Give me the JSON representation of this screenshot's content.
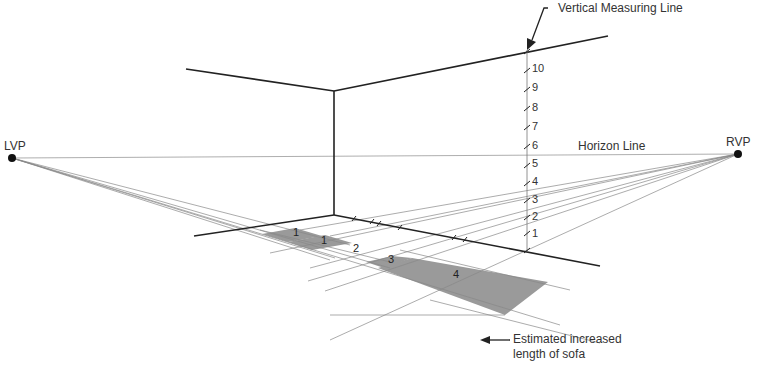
{
  "labels": {
    "lvp": "LVP",
    "rvp": "RVP",
    "horizon_line": "Horizon Line",
    "vertical_measuring_line": "Vertical Measuring Line",
    "estimated_length_line1": "Estimated increased",
    "estimated_length_line2": "length of sofa"
  },
  "measure_ticks": [
    "1",
    "2",
    "3",
    "4",
    "5",
    "6",
    "7",
    "8",
    "9",
    "10"
  ],
  "floor_areas": [
    "1",
    "1",
    "2",
    "3",
    "4"
  ],
  "colors": {
    "line_dark": "#222222",
    "line_light": "#888888",
    "shade": "#9a9a9a",
    "text": "#333333"
  }
}
